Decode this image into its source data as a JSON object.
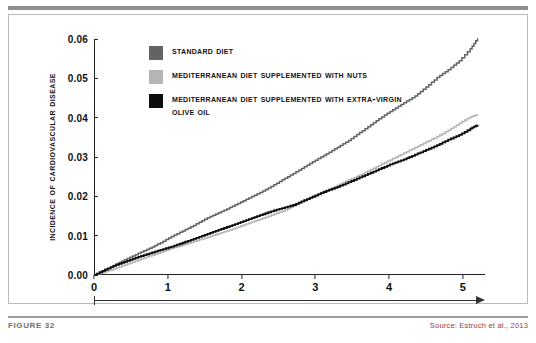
{
  "figure": {
    "label": "FIGURE 32",
    "source": "Source: Estruch et al., 2013"
  },
  "legend": {
    "items": [
      {
        "label": "Standard Diet",
        "color": "#636363"
      },
      {
        "label": "Mediterranean Diet Supplemented with Nuts",
        "color": "#b5b5b5"
      },
      {
        "label": "Mediterranean Diet Supplemented with Extra-Virgin Olive Oil",
        "color": "#0d0d0d"
      }
    ]
  },
  "chart_data": {
    "type": "line",
    "title": "",
    "xlabel": "",
    "ylabel": "Incidence of Cardiovascular Disease",
    "xlim": [
      0,
      5.3
    ],
    "ylim": [
      0,
      0.06
    ],
    "grid": false,
    "legend_position": "top-left",
    "xticks": [
      "0",
      "1",
      "2",
      "3",
      "4",
      "5"
    ],
    "xtick_values": [
      0,
      1,
      2,
      3,
      4,
      5
    ],
    "yticks": [
      "0.00",
      "0.01",
      "0.02",
      "0.03",
      "0.04",
      "0.05",
      "0.06"
    ],
    "ytick_values": [
      0.0,
      0.01,
      0.02,
      0.03,
      0.04,
      0.05,
      0.06
    ],
    "series": [
      {
        "name": "Standard Diet",
        "color": "#636363",
        "x": [
          0,
          0.15,
          0.3,
          0.45,
          0.6,
          0.75,
          0.9,
          1.05,
          1.2,
          1.35,
          1.5,
          1.65,
          1.8,
          1.95,
          2.1,
          2.25,
          2.4,
          2.55,
          2.7,
          2.85,
          3.0,
          3.15,
          3.3,
          3.45,
          3.6,
          3.75,
          3.9,
          4.05,
          4.2,
          4.35,
          4.5,
          4.65,
          4.8,
          4.95,
          5.1,
          5.2
        ],
        "y": [
          0.0,
          0.0012,
          0.0028,
          0.0042,
          0.0055,
          0.0068,
          0.0082,
          0.0098,
          0.0112,
          0.0126,
          0.0142,
          0.0155,
          0.0168,
          0.0182,
          0.0196,
          0.021,
          0.0225,
          0.0242,
          0.0258,
          0.0275,
          0.0292,
          0.0308,
          0.0325,
          0.0342,
          0.0362,
          0.0382,
          0.0402,
          0.042,
          0.0438,
          0.0455,
          0.0478,
          0.0502,
          0.0522,
          0.0545,
          0.0575,
          0.0602
        ]
      },
      {
        "name": "Mediterranean Diet Supplemented with Nuts",
        "color": "#b5b5b5",
        "x": [
          0,
          0.15,
          0.3,
          0.45,
          0.6,
          0.75,
          0.9,
          1.05,
          1.2,
          1.35,
          1.5,
          1.65,
          1.8,
          1.95,
          2.1,
          2.25,
          2.4,
          2.55,
          2.7,
          2.85,
          3.0,
          3.15,
          3.3,
          3.45,
          3.6,
          3.75,
          3.9,
          4.05,
          4.2,
          4.35,
          4.5,
          4.65,
          4.8,
          4.95,
          5.1,
          5.2
        ],
        "y": [
          0.0,
          0.0008,
          0.0018,
          0.0028,
          0.0038,
          0.0048,
          0.0058,
          0.0068,
          0.0076,
          0.0085,
          0.0094,
          0.0103,
          0.0112,
          0.0122,
          0.0132,
          0.0142,
          0.0152,
          0.0162,
          0.0175,
          0.019,
          0.0204,
          0.0216,
          0.0228,
          0.0242,
          0.0254,
          0.0268,
          0.0282,
          0.0296,
          0.031,
          0.0324,
          0.0338,
          0.0352,
          0.0368,
          0.0386,
          0.0402,
          0.0408
        ]
      },
      {
        "name": "Mediterranean Diet Supplemented with Extra-Virgin Olive Oil",
        "color": "#0d0d0d",
        "x": [
          0,
          0.15,
          0.3,
          0.45,
          0.6,
          0.75,
          0.9,
          1.05,
          1.2,
          1.35,
          1.5,
          1.65,
          1.8,
          1.95,
          2.1,
          2.25,
          2.4,
          2.55,
          2.7,
          2.85,
          3.0,
          3.15,
          3.3,
          3.45,
          3.6,
          3.75,
          3.9,
          4.05,
          4.2,
          4.35,
          4.5,
          4.65,
          4.8,
          4.95,
          5.1,
          5.2
        ],
        "y": [
          0.0,
          0.0014,
          0.0026,
          0.0036,
          0.0046,
          0.0055,
          0.0064,
          0.0072,
          0.0082,
          0.0092,
          0.0102,
          0.0112,
          0.0122,
          0.0132,
          0.0142,
          0.0152,
          0.0162,
          0.017,
          0.0178,
          0.019,
          0.0202,
          0.0214,
          0.0224,
          0.0236,
          0.0248,
          0.026,
          0.0272,
          0.0284,
          0.0294,
          0.0306,
          0.0318,
          0.033,
          0.0344,
          0.0356,
          0.0372,
          0.0382
        ]
      }
    ]
  }
}
